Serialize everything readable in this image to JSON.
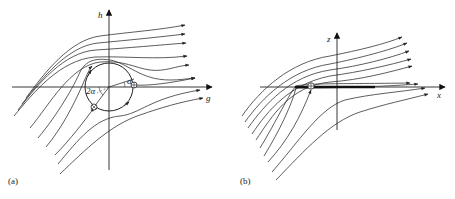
{
  "figure": {
    "panels": [
      {
        "id": "a",
        "label": "(a)",
        "title": "Flow around rotating circle in conformal (g,h) plane",
        "axes": {
          "horizontal": "g",
          "vertical": "h"
        },
        "angle_labels": {
          "small": "α",
          "double": "2α"
        },
        "elements": [
          "circle",
          "two stagnation points",
          "circulation arrows",
          "streamlines"
        ]
      },
      {
        "id": "b",
        "label": "(b)",
        "title": "Flow around flat plate in physical (x,z) plane",
        "axes": {
          "horizontal": "x",
          "vertical": "z"
        },
        "elements": [
          "flat plate",
          "stagnation point",
          "streamlines"
        ]
      }
    ],
    "colors": {
      "line": "#333333",
      "background": "#ffffff"
    }
  }
}
